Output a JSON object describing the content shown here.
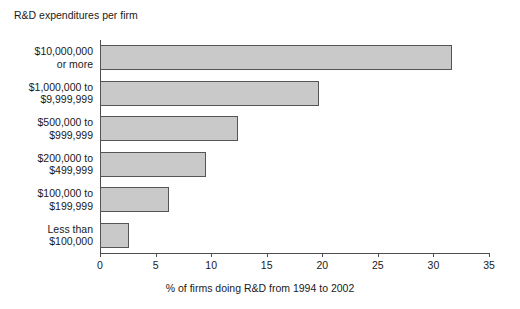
{
  "chart_data": {
    "type": "bar",
    "orientation": "horizontal",
    "title": "R&D expenditures per firm",
    "xlabel": "% of firms doing R&D from 1994 to 2002",
    "ylabel": "",
    "xlim": [
      0,
      35
    ],
    "xticks": [
      0,
      5,
      10,
      15,
      20,
      25,
      30,
      35
    ],
    "xtick_labels": [
      "0",
      "5",
      "10",
      "15",
      "20",
      "25",
      "30",
      "35"
    ],
    "grid": false,
    "legend": false,
    "categories": [
      "$10,000,000\nor more",
      "$1,000,000 to\n$9,999,999",
      "$500,000 to\n$999,999",
      "$200,000 to\n$499,999",
      "$100,000 to\n$199,999",
      "Less than\n$100,000"
    ],
    "category_lines": [
      [
        "$10,000,000",
        "or more"
      ],
      [
        "$1,000,000 to",
        "$9,999,999"
      ],
      [
        "$500,000 to",
        "$999,999"
      ],
      [
        "$200,000 to",
        "$499,999"
      ],
      [
        "$100,000 to",
        "$199,999"
      ],
      [
        "Less than",
        "$100,000"
      ]
    ],
    "values": [
      31.7,
      19.7,
      12.4,
      9.5,
      6.2,
      2.6
    ],
    "bar_fill_color": "#c9c9c9",
    "bar_edge_color": "#555555",
    "axis_color": "#4d4d4d",
    "background_color": "#ffffff"
  }
}
